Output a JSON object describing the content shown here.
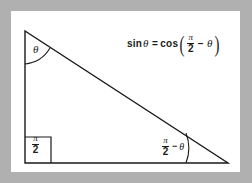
{
  "figure": {
    "background_color": "#b0b0b0",
    "card_color": "#ffffff",
    "stroke_color": "#1a1a1a"
  },
  "equation": {
    "sin_label": "sin",
    "theta_symbol": "θ",
    "equals_symbol": "=",
    "cos_label": "cos",
    "open_paren": "(",
    "close_paren": ")",
    "minus_symbol": "−",
    "pi_symbol": "π",
    "denominator": "2",
    "plain_text": "sin θ = cos(π/2 − θ)"
  },
  "labels": {
    "top_angle": "θ",
    "right_angle_numerator": "π",
    "right_angle_denominator": "2",
    "right_angle_plain": "π/2",
    "bottom_right_numerator": "π",
    "bottom_right_denominator": "2",
    "bottom_right_minus": "−",
    "bottom_right_theta": "θ",
    "bottom_right_plain": "π/2 − θ"
  },
  "geometry": {
    "top_vertex": "25,31",
    "bottom_left_vertex": "25,163",
    "bottom_right_vertex": "228,163",
    "right_angle_box_size": "26"
  }
}
